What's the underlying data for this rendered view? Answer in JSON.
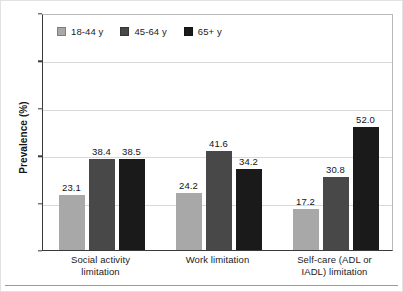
{
  "chart_data": {
    "type": "bar",
    "title": "",
    "subtitle": "",
    "xlabel": "",
    "ylabel": "Prevalence (%)",
    "ylim": [
      0,
      100
    ],
    "yticks": [
      0,
      20,
      40,
      60,
      80,
      100
    ],
    "ytick_labels": [
      "0",
      "20",
      "40",
      "60",
      "80",
      "100"
    ],
    "grid": true,
    "grid_axis": "y",
    "legend_position": "top-left-inside",
    "categories": [
      "Social activity limitation",
      "Work limitation",
      "Self-care (ADL or IADL) limitation"
    ],
    "category_lines": [
      [
        "Social activity",
        "limitation"
      ],
      [
        "Work limitation",
        ""
      ],
      [
        "Self-care (ADL or",
        "IADL) limitation"
      ]
    ],
    "series": [
      {
        "name": "18-44 y",
        "color": "#a8a8a8",
        "values": [
          23.1,
          24.2,
          17.2
        ],
        "labels": [
          "23.1",
          "24.2",
          "17.2"
        ]
      },
      {
        "name": "45-64 y",
        "color": "#484848",
        "values": [
          38.4,
          41.6,
          30.8
        ],
        "labels": [
          "38.4",
          "41.6",
          "30.8"
        ]
      },
      {
        "name": "65+ y",
        "color": "#1a1a1a",
        "values": [
          38.5,
          34.2,
          52.0
        ],
        "labels": [
          "38.5",
          "34.2",
          "52.0"
        ]
      }
    ]
  },
  "legend": {
    "items": [
      {
        "label": "18-44 y",
        "color": "#a8a8a8"
      },
      {
        "label": "45-64 y",
        "color": "#484848"
      },
      {
        "label": "65+ y",
        "color": "#1a1a1a"
      }
    ]
  },
  "axes": {
    "y_title": "Prevalence (%)",
    "y_tick_labels": [
      "100",
      "80",
      "60",
      "40",
      "20",
      "0"
    ]
  }
}
